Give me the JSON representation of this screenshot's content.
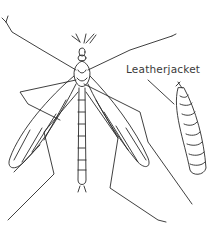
{
  "illustration": {
    "subject": "crane fly and leatherjacket larva line drawing",
    "label": "Leatherjacket",
    "stroke_color": "#2a2a2a",
    "background": "#ffffff"
  }
}
